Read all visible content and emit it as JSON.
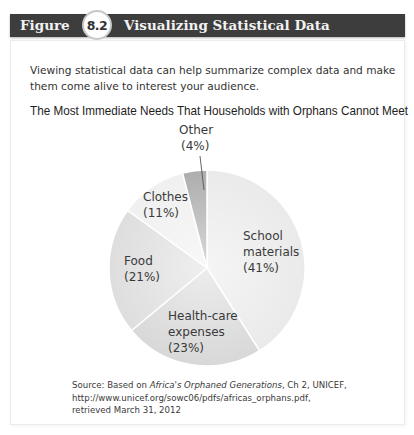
{
  "figure": {
    "label": "Figure",
    "number": "8.2",
    "title": "Visualizing Statistical Data"
  },
  "intro_text": "Viewing statistical data can help summarize complex data and make them come alive to interest your audience.",
  "source": {
    "prefix": "Source: Based on ",
    "work_title": "Africa's Orphaned Generations",
    "suffix": ", Ch 2, UNICEF,",
    "line2": "http://www.unicef.org/sowc06/pdfs/africas_orphans.pdf,",
    "line3": "retrieved March 31, 2012"
  },
  "colors": {
    "header_bg": "#3d3d3d",
    "school": "#e9e9e9",
    "health": "#d6d6d6",
    "food": "#dcdcdc",
    "clothes": "#efefef",
    "other": "#a9a9a9"
  },
  "chart_data": {
    "type": "pie",
    "title": "The Most Immediate Needs That Households with Orphans Cannot Meet",
    "categories": [
      "School materials",
      "Health-care expenses",
      "Food",
      "Clothes",
      "Other"
    ],
    "values": [
      41,
      23,
      21,
      11,
      4
    ],
    "unit": "%",
    "labels": [
      {
        "line1": "School",
        "line2": "materials",
        "line3": "(41%)"
      },
      {
        "line1": "Health-care",
        "line2": "expenses",
        "line3": "(23%)"
      },
      {
        "line1": "Food",
        "line2": "(21%)"
      },
      {
        "line1": "Clothes",
        "line2": "(11%)"
      },
      {
        "line1": "Other",
        "line2": "(4%)"
      }
    ],
    "legend": "none (labels inside slices)",
    "start_angle": "12 o'clock, clockwise"
  }
}
